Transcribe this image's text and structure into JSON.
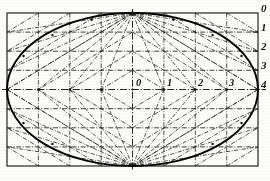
{
  "figure": {
    "type": "geometric-construction",
    "background_color": "#fdfdfb",
    "ink_color": "#1a1a1a"
  },
  "geometry": {
    "bounding_rect": {
      "x": 7,
      "y": 13,
      "width": 251,
      "height": 153
    },
    "center": {
      "x": 132.5,
      "y": 89.5
    },
    "semi_axis_a": 125.5,
    "semi_axis_b": 76.5,
    "top_vertex": {
      "x": 132.5,
      "y": 13
    },
    "bottom_vertex": {
      "x": 132.5,
      "y": 166
    },
    "left_vertex": {
      "x": 7,
      "y": 89.5
    },
    "right_vertex": {
      "x": 258,
      "y": 89.5
    },
    "divisions": 4
  },
  "labels": {
    "horizontal_axis": [
      {
        "text": "0",
        "x": 136,
        "y": 78
      },
      {
        "text": "1",
        "x": 167,
        "y": 78
      },
      {
        "text": "2",
        "x": 198,
        "y": 78
      },
      {
        "text": "3",
        "x": 229,
        "y": 78
      }
    ],
    "vertical_edge": [
      {
        "text": "0",
        "x": 261,
        "y": 4
      },
      {
        "text": "1",
        "x": 261,
        "y": 23
      },
      {
        "text": "2",
        "x": 261,
        "y": 42
      },
      {
        "text": "3",
        "x": 261,
        "y": 61
      },
      {
        "text": "4",
        "x": 261,
        "y": 80
      }
    ]
  },
  "line_styles": {
    "outline": "solid-thick",
    "construction": "dash-dot-thin",
    "frame": "solid-thin"
  }
}
